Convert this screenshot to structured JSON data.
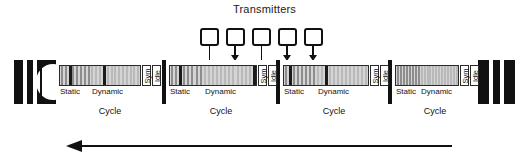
{
  "title": "Transmitters",
  "transmitters": [
    {
      "id": "tx-1",
      "x": 200,
      "has_arrow": false,
      "target_x": 209
    },
    {
      "id": "tx-2",
      "x": 226,
      "has_arrow": true,
      "target_x": 235
    },
    {
      "id": "tx-3",
      "x": 252,
      "has_arrow": false,
      "target_x": 261
    },
    {
      "id": "tx-4",
      "x": 278,
      "has_arrow": true,
      "target_x": 287
    },
    {
      "id": "tx-5",
      "x": 304,
      "has_arrow": true,
      "target_x": 313
    }
  ],
  "timeline": {
    "left_endcap": {
      "type": "torn-start",
      "stripes": 2
    },
    "right_endcap": {
      "type": "torn-end",
      "stripes": 2
    },
    "direction_arrow": {
      "direction": "left",
      "label": ""
    }
  },
  "segments": {
    "static_label": "Static",
    "dynamic_label": "Dynamic",
    "sym_label": "Sym",
    "idle_label": "Idle"
  },
  "cycles": [
    {
      "name": "cycle-1",
      "caption": "Cycle",
      "left": 56,
      "width": 108,
      "static_slots": 8,
      "dynamic_slots": 13,
      "active_static": [
        2
      ],
      "active_dynamic": [
        3
      ]
    },
    {
      "name": "cycle-2",
      "caption": "Cycle",
      "left": 164,
      "width": 114,
      "static_slots": 8,
      "dynamic_slots": 13,
      "active_static": [
        2
      ],
      "active_dynamic": [
        12
      ]
    },
    {
      "name": "cycle-3",
      "caption": "Cycle",
      "left": 278,
      "width": 112,
      "static_slots": 8,
      "dynamic_slots": 13,
      "active_static": [
        1
      ],
      "active_dynamic": [
        2
      ]
    },
    {
      "name": "cycle-4",
      "caption": "Cycle",
      "left": 390,
      "width": 90,
      "static_slots": 8,
      "dynamic_slots": 13,
      "active_static": [],
      "active_dynamic": []
    }
  ]
}
